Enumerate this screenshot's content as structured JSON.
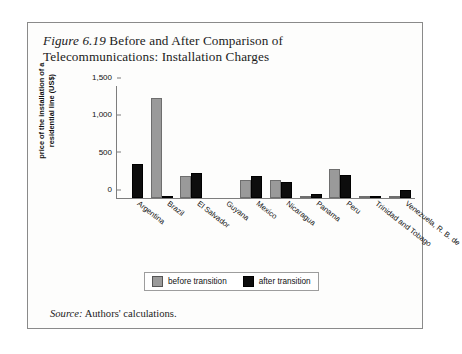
{
  "figure": {
    "label": "Figure",
    "number": "6.19",
    "title_rest": "Before and After Comparison of Telecommunications: Installation Charges",
    "source_label": "Source:",
    "source_text": "Authors' calculations."
  },
  "legend": {
    "before_label": "before transition",
    "after_label": "after transition",
    "before_color": "#9a9a9a",
    "after_color": "#0d0d0d"
  },
  "chart_data": {
    "type": "bar",
    "title": "Figure 6.19 Before and After Comparison of Telecommunications: Installation Charges",
    "xlabel": "",
    "ylabel": "price of the installation of a residential line (US$)",
    "ylim": [
      0,
      1500
    ],
    "yticks": [
      0,
      500,
      1000,
      1500
    ],
    "ytick_labels": [
      "0",
      "500",
      "1,000",
      "1,500"
    ],
    "grid": false,
    "legend_position": "bottom-center",
    "categories": [
      "Argentina",
      "Brazil",
      "El Salvador",
      "Guyana",
      "Mexico",
      "Nicaragua",
      "Panama",
      "Peru",
      "Trinidad and Tobago",
      "Venezuela, R. B. de"
    ],
    "series": [
      {
        "name": "before transition",
        "color": "#9a9a9a",
        "values": [
          0,
          1340,
          295,
          0,
          235,
          240,
          15,
          390,
          10,
          30
        ]
      },
      {
        "name": "after transition",
        "color": "#0d0d0d",
        "values": [
          450,
          30,
          335,
          0,
          290,
          215,
          60,
          310,
          5,
          105
        ]
      }
    ]
  }
}
